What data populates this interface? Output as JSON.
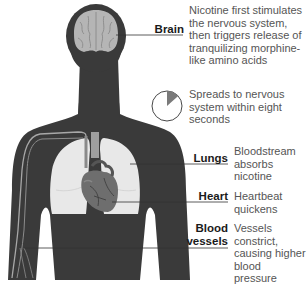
{
  "diagram": {
    "colors": {
      "body": "#3a3a3a",
      "brain": "#b5b5b5",
      "lungs": "#e8e8e8",
      "heart": "#6e6e6e",
      "vessel": "#9a9a9a",
      "leader_line": "#333333",
      "pie_slice": "#7a7a7a",
      "label_text": "#1a1a1a",
      "description_text": "#555555"
    },
    "callouts": [
      {
        "id": "brain",
        "label": "Brain",
        "description": "Nicotine first stimulates\nthe nervous system,\nthen triggers release of\ntranquilizing morphine-\nlike amino acids"
      },
      {
        "id": "timer",
        "label": "",
        "description": "Spreads to nervous\nsystem within eight\nseconds",
        "pie_fraction_seconds": 8,
        "pie_total_seconds": 60
      },
      {
        "id": "lungs",
        "label": "Lungs",
        "description": "Bloodstream\nabsorbs\nnicotine"
      },
      {
        "id": "heart",
        "label": "Heart",
        "description": "Heartbeat\nquickens"
      },
      {
        "id": "blood-vessels",
        "label": "Blood\nvessels",
        "label_line1": "Blood",
        "label_line2": "vessels",
        "description": "Vessels\nconstrict,\ncausing higher\nblood pressure"
      }
    ]
  }
}
